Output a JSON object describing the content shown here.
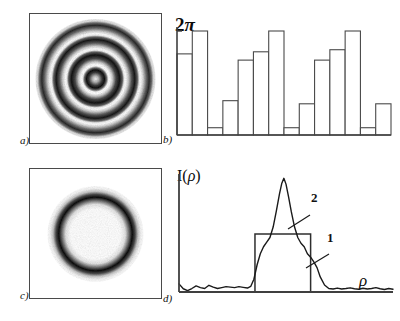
{
  "figure": {
    "panels": [
      {
        "id": "a",
        "label": "a)",
        "caption_text": "a)"
      },
      {
        "id": "b",
        "label": "b)",
        "caption_text": "b)"
      },
      {
        "id": "c",
        "label": "c)",
        "caption_text": "c)"
      },
      {
        "id": "d",
        "label": "d)",
        "caption_text": "d)"
      }
    ]
  },
  "panel_a": {
    "label": "a)",
    "description": "concentric-rings-grayscale-sawtooth",
    "rings": 5,
    "ink": "#111111"
  },
  "panel_b": {
    "label": "b)",
    "axis_top_label": "2",
    "axis_top_symbol": "π",
    "axis_top_full": "2π"
  },
  "panel_c": {
    "label": "c)",
    "description": "single-dark-ring",
    "ink": "#111111"
  },
  "panel_d": {
    "label": "d)",
    "ylabel_prefix": "I(",
    "ylabel_symbol": "ρ",
    "ylabel_suffix": ")",
    "xlabel": "ρ",
    "curve1_label": "1",
    "curve2_label": "2"
  },
  "chart_data": [
    {
      "type": "bar",
      "panel": "b",
      "title": "",
      "ylabel": "2π",
      "xlabel": "",
      "ylim": [
        0,
        1.0
      ],
      "ytick_labels": [
        "2π"
      ],
      "ytick_values": [
        1.0
      ],
      "grid": false,
      "legend": "none",
      "categories": [
        "1",
        "2",
        "3",
        "4",
        "5",
        "6",
        "7",
        "8",
        "9",
        "10",
        "11",
        "12",
        "13",
        "14"
      ],
      "values": [
        0.78,
        1.0,
        0.07,
        0.33,
        0.72,
        0.8,
        1.0,
        0.07,
        0.3,
        0.72,
        0.82,
        1.0,
        0.07,
        0.3
      ],
      "note": "phase steps histogram, bar tops normalized to 2pi"
    },
    {
      "type": "line",
      "panel": "d",
      "title": "",
      "ylabel": "I(ρ)",
      "xlabel": "ρ",
      "grid": false,
      "legend": "inline-labels",
      "xlim": [
        0,
        1
      ],
      "ylim": [
        0,
        1
      ],
      "series": [
        {
          "name": "1",
          "style": "rect-step",
          "x": [
            0.0,
            0.355,
            0.355,
            0.615,
            0.615,
            1.0
          ],
          "values": [
            0.0,
            0.0,
            0.5,
            0.5,
            0.0,
            0.0
          ]
        },
        {
          "name": "2",
          "style": "noisy-peak",
          "x": [
            0.0,
            0.02,
            0.04,
            0.06,
            0.08,
            0.1,
            0.12,
            0.14,
            0.16,
            0.18,
            0.2,
            0.22,
            0.24,
            0.26,
            0.28,
            0.3,
            0.32,
            0.335,
            0.35,
            0.365,
            0.38,
            0.395,
            0.41,
            0.425,
            0.44,
            0.455,
            0.47,
            0.48,
            0.49,
            0.5,
            0.512,
            0.525,
            0.54,
            0.555,
            0.57,
            0.585,
            0.6,
            0.615,
            0.63,
            0.645,
            0.66,
            0.68,
            0.7,
            0.72,
            0.74,
            0.76,
            0.78,
            0.8,
            0.82,
            0.84,
            0.86,
            0.88,
            0.9,
            0.92,
            0.94,
            0.96,
            0.98,
            1.0
          ],
          "values": [
            0.07,
            0.028,
            0.012,
            0.03,
            0.052,
            0.038,
            0.03,
            0.058,
            0.042,
            0.03,
            0.038,
            0.046,
            0.042,
            0.038,
            0.046,
            0.04,
            0.034,
            0.048,
            0.11,
            0.235,
            0.33,
            0.39,
            0.43,
            0.47,
            0.56,
            0.7,
            0.85,
            0.935,
            0.98,
            0.93,
            0.82,
            0.69,
            0.56,
            0.47,
            0.42,
            0.39,
            0.33,
            0.3,
            0.26,
            0.21,
            0.13,
            0.06,
            0.03,
            0.026,
            0.034,
            0.026,
            0.03,
            0.036,
            0.028,
            0.024,
            0.032,
            0.026,
            0.03,
            0.038,
            0.028,
            0.022,
            0.03,
            0.024
          ]
        }
      ]
    }
  ]
}
